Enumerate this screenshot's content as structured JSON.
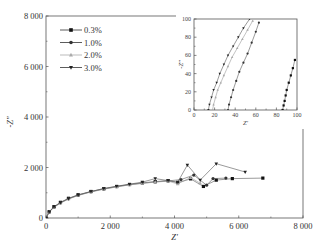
{
  "chart_data": [
    {
      "type": "scatter",
      "subtype": "nyquist",
      "title": "",
      "xlabel": "Z'",
      "ylabel": "-Z''",
      "xlim": [
        0,
        8000
      ],
      "ylim": [
        0,
        8000
      ],
      "xticks": [
        0,
        2000,
        4000,
        6000,
        8000
      ],
      "xtick_labels": [
        "0",
        "2 000",
        "4 000",
        "6 000",
        "8 000"
      ],
      "yticks": [
        0,
        2000,
        4000,
        6000,
        8000
      ],
      "ytick_labels": [
        "0",
        "2 000",
        "4 000",
        "6 000",
        "8 000"
      ],
      "grid": false,
      "legend_position": "upper left",
      "series": [
        {
          "name": "0.3%",
          "marker": "square",
          "color": "#111111",
          "x": [
            0,
            100,
            250,
            450,
            700,
            1000,
            1400,
            1800,
            2200,
            2600,
            3000,
            3400,
            3800,
            4100,
            4500,
            4900,
            5300,
            5800,
            6750
          ],
          "y": [
            0,
            250,
            450,
            620,
            780,
            920,
            1050,
            1160,
            1250,
            1330,
            1390,
            1440,
            1480,
            1400,
            1550,
            1250,
            1500,
            1560,
            1580
          ]
        },
        {
          "name": "1.0%",
          "marker": "circle",
          "color": "#333333",
          "x": [
            0,
            100,
            250,
            450,
            700,
            1000,
            1400,
            1800,
            2200,
            2600,
            3000,
            3400,
            3800,
            4200,
            4600,
            5000,
            5200,
            5600
          ],
          "y": [
            0,
            240,
            430,
            600,
            760,
            900,
            1040,
            1150,
            1240,
            1320,
            1380,
            1430,
            1470,
            1520,
            1700,
            1300,
            1560,
            1580
          ]
        },
        {
          "name": "2.0%",
          "marker": "triangle-up",
          "color": "#aaaaaa",
          "x": [
            0,
            100,
            250,
            450,
            700,
            1000,
            1400,
            1800,
            2200,
            2600,
            3000,
            3400,
            3800,
            4100,
            4500,
            4800
          ],
          "y": [
            0,
            230,
            420,
            590,
            750,
            890,
            1030,
            1140,
            1230,
            1310,
            1370,
            1420,
            1460,
            1350,
            1600,
            1380
          ]
        },
        {
          "name": "3.0%",
          "marker": "triangle-down",
          "color": "#222222",
          "x": [
            0,
            100,
            250,
            450,
            700,
            1000,
            1400,
            1800,
            2200,
            2600,
            3000,
            3400,
            3800,
            4100,
            4400,
            4800,
            5300,
            6200
          ],
          "y": [
            0,
            240,
            440,
            610,
            770,
            910,
            1050,
            1170,
            1260,
            1340,
            1420,
            1560,
            1480,
            1420,
            2100,
            1500,
            2150,
            1820
          ]
        }
      ]
    },
    {
      "type": "scatter",
      "subtype": "nyquist-inset",
      "title": "",
      "xlabel": "Z'",
      "ylabel": "-Z''",
      "xlim": [
        0,
        100
      ],
      "ylim": [
        0,
        100
      ],
      "xticks": [
        0,
        20,
        40,
        60,
        80,
        100
      ],
      "xtick_labels": [
        "0",
        "20",
        "40",
        "60",
        "80",
        "100"
      ],
      "yticks": [
        0,
        20,
        40,
        60,
        80,
        100
      ],
      "ytick_labels": [
        "0",
        "20",
        "40",
        "60",
        "80",
        "100"
      ],
      "grid": false,
      "series": [
        {
          "name": "0.3%",
          "marker": "square",
          "color": "#111111",
          "x": [
            86,
            87,
            88,
            89,
            90,
            92,
            94,
            96,
            98
          ],
          "y": [
            0,
            5,
            10,
            16,
            22,
            30,
            38,
            46,
            55
          ]
        },
        {
          "name": "1.0%",
          "marker": "circle",
          "color": "#333333",
          "x": [
            33,
            34,
            36,
            38,
            41,
            44,
            48,
            52,
            56,
            60,
            63
          ],
          "y": [
            0,
            6,
            14,
            22,
            32,
            42,
            52,
            62,
            74,
            86,
            96
          ]
        },
        {
          "name": "2.0%",
          "marker": "triangle-up",
          "color": "#aaaaaa",
          "x": [
            18,
            19,
            21,
            23,
            26,
            29,
            33,
            37,
            42,
            47,
            52,
            57
          ],
          "y": [
            0,
            6,
            14,
            22,
            30,
            38,
            48,
            58,
            68,
            78,
            88,
            98
          ]
        },
        {
          "name": "3.0%",
          "marker": "triangle-down",
          "color": "#222222",
          "x": [
            14,
            15,
            17,
            19,
            22,
            25,
            29,
            33,
            38,
            43,
            48,
            54
          ],
          "y": [
            0,
            6,
            14,
            22,
            30,
            40,
            50,
            60,
            70,
            80,
            90,
            100
          ]
        }
      ]
    }
  ],
  "legend": {
    "items": [
      {
        "label": "0.3%",
        "marker": "square",
        "color": "#111111"
      },
      {
        "label": "1.0%",
        "marker": "circle",
        "color": "#333333"
      },
      {
        "label": "2.0%",
        "marker": "triangle-up",
        "color": "#aaaaaa"
      },
      {
        "label": "3.0%",
        "marker": "triangle-down",
        "color": "#222222"
      }
    ]
  },
  "axes": {
    "main": {
      "xlabel": "Z'",
      "ylabel": "-Z''"
    },
    "inset": {
      "xlabel": "Z'",
      "ylabel": "-Z''"
    }
  }
}
